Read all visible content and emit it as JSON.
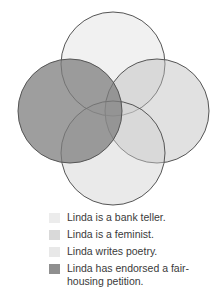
{
  "diagram": {
    "type": "venn",
    "circles": [
      {
        "id": "top",
        "cx": 113,
        "cy": 64,
        "r": 52,
        "fill": "#d6d6d6",
        "opacity": 0.35
      },
      {
        "id": "right",
        "cx": 157,
        "cy": 111,
        "r": 52,
        "fill": "#bdbdbd",
        "opacity": 0.45
      },
      {
        "id": "bottom",
        "cx": 113,
        "cy": 153,
        "r": 52,
        "fill": "#d0d0d0",
        "opacity": 0.45
      },
      {
        "id": "left",
        "cx": 70,
        "cy": 111,
        "r": 52,
        "fill": "#7d7d7d",
        "opacity": 0.75
      }
    ],
    "stroke": "#555555"
  },
  "legend": {
    "items": [
      {
        "label": "Linda is a bank teller.",
        "color": "#ececec"
      },
      {
        "label": "Linda is a feminist.",
        "color": "#d9d9d9"
      },
      {
        "label": "Linda writes poetry.",
        "color": "#e8e8e8"
      },
      {
        "label": "Linda has endorsed a fair-housing petition.",
        "color": "#8f8f8f"
      }
    ]
  }
}
